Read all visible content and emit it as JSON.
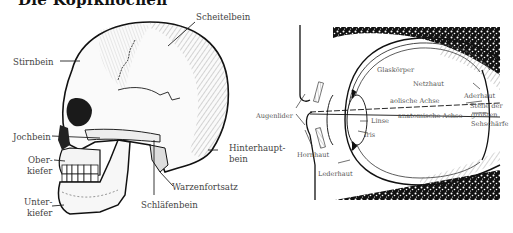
{
  "title": "Die Kopfknochen",
  "skull": {
    "labels": {
      "scheitelbein": "Scheitelbein",
      "stirnbein": "Stirnbein",
      "jochbein": "Jochbein",
      "oberkiefer_1": "Ober-",
      "oberkiefer_2": "kiefer",
      "unterkiefer_1": "Unter-",
      "unterkiefer_2": "kiefer",
      "hinterhauptbein_1": "Hinterhaupt-",
      "hinterhauptbein_2": "bein",
      "warzenfortsatz": "Warzenfortsatz",
      "schlaefenbein": "Schläfenbein"
    }
  },
  "eye": {
    "labels": {
      "glaskoerper": "Glaskörper",
      "netzhaut": "Netzhaut",
      "aderhaut": "Aderhaut",
      "optische_achse": "aolische Achse",
      "anatomische_achse": "anatomische Achse",
      "stelle_1": "Stelle der",
      "stelle_2": "größten",
      "stelle_3": "Sehschärfe",
      "augenlider": "Augenlider",
      "linse": "Linse",
      "iris": "Iris",
      "hornhaut": "Hornhaut",
      "lederhaut": "Lederhaut"
    }
  }
}
